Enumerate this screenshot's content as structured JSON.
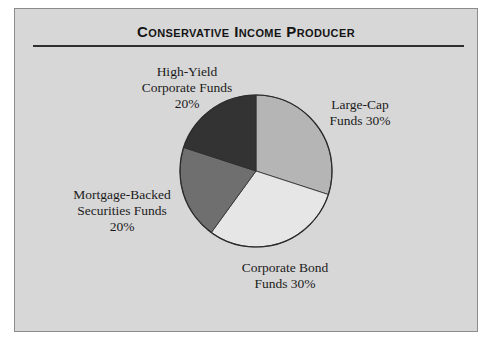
{
  "card": {
    "title": "Conservative Income Producer"
  },
  "chart_data": {
    "type": "pie",
    "title": "Conservative Income Producer",
    "direction": "clockwise",
    "start_angle_deg_from_north": 0,
    "outline_color": "#2b2b2b",
    "background_color": "#d7d7d7",
    "slices": [
      {
        "id": "large-cap",
        "label": "Large-Cap Funds",
        "value_pct": 30,
        "color": "#b5b5b5",
        "label_lines": [
          "Large-Cap",
          "Funds 30%"
        ]
      },
      {
        "id": "corporate-bond",
        "label": "Corporate Bond Funds",
        "value_pct": 30,
        "color": "#e6e6e6",
        "label_lines": [
          "Corporate Bond",
          "Funds 30%"
        ]
      },
      {
        "id": "mortgage-backed",
        "label": "Mortgage-Backed Securities Funds",
        "value_pct": 20,
        "color": "#6f6f6f",
        "label_lines": [
          "Mortgage-Backed",
          "Securities Funds",
          "20%"
        ]
      },
      {
        "id": "high-yield",
        "label": "High-Yield Corporate Funds",
        "value_pct": 20,
        "color": "#333333",
        "label_lines": [
          "High-Yield",
          "Corporate Funds",
          "20%"
        ]
      }
    ]
  }
}
